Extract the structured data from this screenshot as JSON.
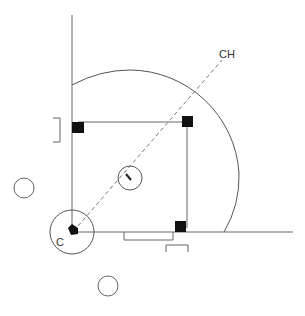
{
  "diagram": {
    "title": "",
    "labels": {
      "catcher": "C",
      "center_direction": "CH",
      "pitcher_mark": "1"
    },
    "colors": {
      "line": "#555555",
      "base": "#111111",
      "dash": "#777777",
      "background": "#ffffff"
    },
    "elements": [
      "left foul line",
      "right foul line",
      "infield arc",
      "home plate",
      "first base",
      "second base",
      "third base",
      "pitcher circle",
      "catcher circle",
      "dashed line home to CH",
      "third-base coach box",
      "first-base coach box",
      "on-deck circle left",
      "on-deck circle bottom",
      "runner lane bracket"
    ]
  }
}
